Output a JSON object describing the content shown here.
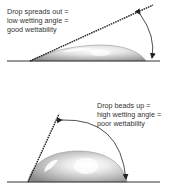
{
  "diagram": {
    "panels": [
      {
        "id": "good-wettability",
        "caption_lines": [
          "Drop spreads out =",
          "low wetting angle =",
          "good wettability"
        ],
        "contact_angle": "low"
      },
      {
        "id": "poor-wettability",
        "caption_lines": [
          "Drop beads up =",
          "high wetting angle =",
          "poor wettability"
        ],
        "contact_angle": "high"
      }
    ],
    "colors": {
      "baseline": "#333333",
      "tangent_line": "#222222",
      "drop_fill": "#bdbdbd",
      "drop_highlight": "#ffffff",
      "text": "#333333"
    }
  }
}
